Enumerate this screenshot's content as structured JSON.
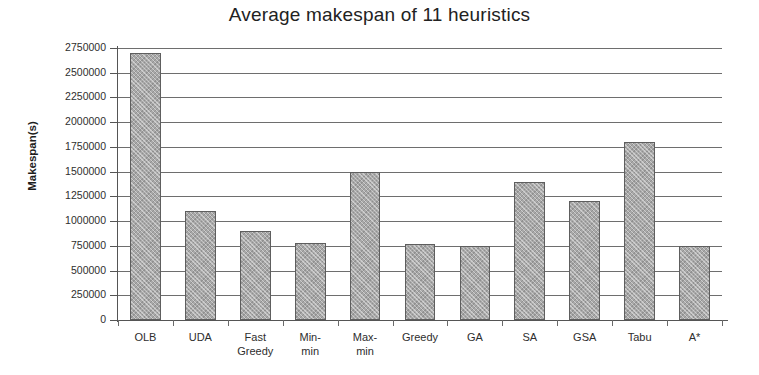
{
  "chart_data": {
    "type": "bar",
    "title": "Average makespan of 11 heuristics",
    "xlabel": "",
    "ylabel": "Makespan(s)",
    "categories": [
      "OLB",
      "UDA",
      "Fast Greedy",
      "Min-min",
      "Max-min",
      "Greedy",
      "GA",
      "SA",
      "GSA",
      "Tabu",
      "A*"
    ],
    "category_lines": [
      [
        "OLB"
      ],
      [
        "UDA"
      ],
      [
        "Fast",
        "Greedy"
      ],
      [
        "Min-",
        "min"
      ],
      [
        "Max-",
        "min"
      ],
      [
        "Greedy"
      ],
      [
        "GA"
      ],
      [
        "SA"
      ],
      [
        "GSA"
      ],
      [
        "Tabu"
      ],
      [
        "A*"
      ]
    ],
    "values": [
      2700000,
      1100000,
      900000,
      780000,
      1500000,
      770000,
      750000,
      1400000,
      1200000,
      1800000,
      750000
    ],
    "ylim": [
      0,
      2750000
    ],
    "ytick_values": [
      0,
      250000,
      500000,
      750000,
      1000000,
      1250000,
      1500000,
      1750000,
      2000000,
      2250000,
      2500000,
      2750000
    ],
    "ytick_labels": [
      "0",
      "250000",
      "500000",
      "750000",
      "1000000",
      "1250000",
      "1500000",
      "1750000",
      "2000000",
      "2250000",
      "2500000",
      "2750000"
    ],
    "grid": true,
    "legend": false,
    "bar_color": "#a8a8a8",
    "bar_border_color": "#5e5e5e",
    "grid_color": "#6e6e6e",
    "background_color": "#ffffff",
    "text_color": "#2e2e2e"
  }
}
